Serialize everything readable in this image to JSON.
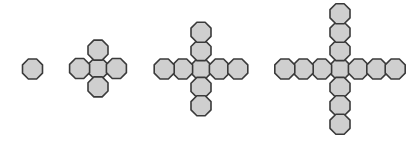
{
  "diagram": {
    "title": "",
    "shape": "octagon",
    "colors": {
      "fill": "#cfcfcf",
      "stroke": "#3a3a3a",
      "background": "#ffffff"
    },
    "octagon_size": 20,
    "spacing": 18.4,
    "figures": [
      {
        "step": 1,
        "center": [
          32.5,
          69
        ],
        "arm_length": 0,
        "count": 1
      },
      {
        "step": 2,
        "center": [
          98,
          68.5
        ],
        "arm_length": 1,
        "count": 5
      },
      {
        "step": 3,
        "center": [
          201,
          69
        ],
        "arm_length": 2,
        "count": 9
      },
      {
        "step": 4,
        "center": [
          340,
          69
        ],
        "arm_length": 3,
        "count": 13
      }
    ]
  }
}
